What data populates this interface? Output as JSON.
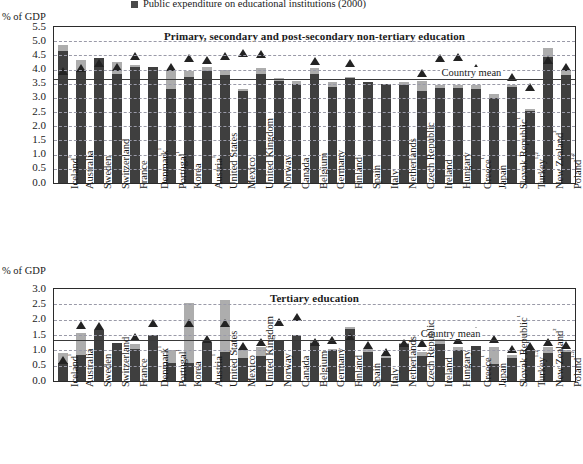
{
  "legend": {
    "label": "Public expenditure on educational institutions (2000)",
    "swatch_color": "#4a4a4a"
  },
  "axis_caption_top": "% of GDP",
  "axis_caption_bottom": "% of GDP",
  "colors": {
    "bar_dark": "#3f3f3f",
    "bar_light": "#adadad",
    "marker": "#232323",
    "grid": "#9a9aa8",
    "mean_line": "#3a3a3a",
    "frame": "#2b2b2b"
  },
  "chart_data": [
    {
      "type": "bar",
      "id": "primary-secondary",
      "title": "Primary, secondary and post-secondary non-tertiary education",
      "xlabel": "",
      "ylabel": "% of GDP",
      "ylim": [
        0.0,
        5.5
      ],
      "ytick_labels": [
        "5.5",
        "5.0",
        "4.5",
        "4.0",
        "3.5",
        "3.0",
        "2.5",
        "2.0",
        "1.5",
        "1.0",
        "0.5",
        "0.0"
      ],
      "ytick_values": [
        5.5,
        5.0,
        4.5,
        4.0,
        3.5,
        3.0,
        2.5,
        2.0,
        1.5,
        1.0,
        0.5,
        0.0
      ],
      "grid": true,
      "legend_position": "top",
      "country_mean": 3.65,
      "country_mean_label": "Country mean",
      "categories": [
        "Iceland¹",
        "Australia",
        "Sweden",
        "Switzerland",
        "France",
        "Denmark¹",
        "Portugal¹",
        "Korea",
        "Austria¹",
        "United States",
        "Mexico",
        "United Kingdom",
        "Norway",
        "Canada",
        "Belgium",
        "Germany",
        "Finland",
        "Spain",
        "Italy",
        "Netherlands",
        "Czech Republic",
        "Ireland",
        "Hungary",
        "Greece¹",
        "Japan",
        "Slovak Republic¹",
        "Turkey¹·²",
        "New Zealand²",
        "Poland¹·²"
      ],
      "series": [
        {
          "name": "Public expenditure on educational institutions (2000)",
          "values": [
            4.65,
            3.95,
            4.4,
            3.85,
            4.1,
            4.1,
            3.3,
            3.75,
            3.95,
            3.8,
            3.25,
            3.85,
            3.6,
            3.5,
            3.85,
            3.4,
            3.7,
            3.55,
            3.5,
            3.45,
            3.25,
            3.35,
            3.35,
            3.3,
            3.0,
            3.4,
            2.55,
            4.45,
            3.8
          ]
        },
        {
          "name": "Total expenditure on educational institutions (light top segment)",
          "values": [
            4.85,
            4.35,
            4.4,
            4.25,
            4.15,
            4.1,
            4.0,
            3.95,
            4.1,
            4.0,
            3.3,
            4.05,
            3.7,
            3.6,
            4.05,
            3.55,
            3.75,
            3.55,
            3.5,
            3.55,
            3.6,
            3.45,
            3.45,
            3.45,
            3.15,
            3.45,
            2.6,
            4.75,
            3.95
          ]
        }
      ],
      "markers": {
        "name": "Country data point marker",
        "values": [
          3.8,
          3.9,
          4.1,
          3.95,
          4.35,
          null,
          3.95,
          4.25,
          4.2,
          4.35,
          4.45,
          4.4,
          null,
          null,
          4.15,
          null,
          4.1,
          null,
          null,
          null,
          3.75,
          4.25,
          4.3,
          3.9,
          null,
          3.6,
          3.25,
          4.2,
          3.95
        ]
      }
    },
    {
      "type": "bar",
      "id": "tertiary",
      "title": "Tertiary education",
      "xlabel": "",
      "ylabel": "% of GDP",
      "ylim": [
        0.0,
        3.0
      ],
      "ytick_labels": [
        "3.0",
        "2.5",
        "2.0",
        "1.5",
        "1.0",
        "0.5",
        "0.0"
      ],
      "ytick_values": [
        3.0,
        2.5,
        2.0,
        1.5,
        1.0,
        0.5,
        0.0
      ],
      "grid": true,
      "legend_position": "top",
      "country_mean": 1.35,
      "country_mean_label": "Country mean",
      "categories": [
        "Iceland¹",
        "Australia",
        "Sweden",
        "Switzerland",
        "France",
        "Denmark¹",
        "Portugal¹",
        "Korea",
        "Austria¹",
        "United States",
        "Mexico",
        "United Kingdom",
        "Norway",
        "Canada",
        "Belgium",
        "Germany",
        "Finland",
        "Spain",
        "Italy",
        "Netherlands",
        "Czech Republic",
        "Ireland",
        "Hungary",
        "Greece¹",
        "Japan",
        "Slovak Republic¹",
        "Turkey¹·²",
        "New Zealand²",
        "Poland¹·²"
      ],
      "series": [
        {
          "name": "Public expenditure on educational institutions (2000)",
          "values": [
            0.6,
            0.85,
            1.65,
            1.25,
            1.05,
            1.5,
            0.6,
            0.6,
            1.25,
            0.95,
            0.75,
            0.8,
            1.3,
            1.5,
            1.25,
            1.0,
            1.7,
            0.95,
            0.75,
            1.2,
            0.8,
            1.2,
            1.0,
            1.15,
            0.55,
            0.75,
            1.0,
            0.9,
            0.95
          ]
        },
        {
          "name": "Total expenditure on educational institutions (light top segment)",
          "values": [
            0.9,
            1.55,
            1.65,
            1.25,
            1.2,
            1.5,
            1.0,
            2.55,
            1.3,
            2.65,
            1.05,
            1.1,
            1.3,
            1.5,
            1.3,
            1.05,
            1.75,
            1.05,
            0.85,
            1.25,
            0.95,
            1.4,
            1.1,
            1.15,
            1.1,
            0.85,
            1.05,
            1.1,
            1.0
          ]
        }
      ],
      "markers": {
        "name": "Country data point marker",
        "values": [
          0.55,
          1.7,
          1.65,
          null,
          1.3,
          1.75,
          null,
          1.75,
          1.25,
          1.75,
          1.0,
          1.15,
          1.8,
          1.95,
          1.15,
          1.2,
          1.3,
          1.05,
          0.8,
          1.1,
          1.1,
          1.45,
          1.2,
          1.5,
          1.25,
          0.9,
          1.0,
          1.15,
          1.05
        ]
      }
    }
  ]
}
